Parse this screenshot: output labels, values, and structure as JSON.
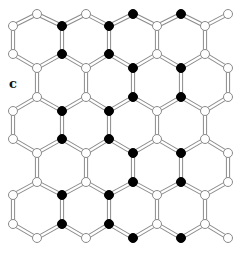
{
  "figure": {
    "panel_label": "c",
    "colors": {
      "background": "#ffffff",
      "bond_outline": "#8a8a8a",
      "bond_fill": "#ffffff",
      "node_white_fill": "#ffffff",
      "node_white_stroke": "#8a8a8a",
      "node_black_fill": "#000000"
    },
    "columns_x": [
      13,
      37,
      62,
      86,
      109,
      133,
      157,
      181,
      205,
      228
    ],
    "levels": [
      {
        "y": 14,
        "nodes": [
          {
            "x": 37,
            "c": "white"
          },
          {
            "x": 86,
            "c": "white"
          },
          {
            "x": 133,
            "c": "black"
          },
          {
            "x": 181,
            "c": "black"
          },
          {
            "x": 228,
            "c": "white"
          }
        ]
      },
      {
        "y": 26,
        "nodes": [
          {
            "x": 13,
            "c": "white"
          },
          {
            "x": 62,
            "c": "black"
          },
          {
            "x": 109,
            "c": "black"
          },
          {
            "x": 157,
            "c": "white"
          },
          {
            "x": 205,
            "c": "white"
          }
        ]
      },
      {
        "y": 54,
        "nodes": [
          {
            "x": 13,
            "c": "white"
          },
          {
            "x": 62,
            "c": "black"
          },
          {
            "x": 109,
            "c": "black"
          },
          {
            "x": 157,
            "c": "white"
          },
          {
            "x": 205,
            "c": "white"
          }
        ]
      },
      {
        "y": 68,
        "nodes": [
          {
            "x": 37,
            "c": "white"
          },
          {
            "x": 86,
            "c": "white"
          },
          {
            "x": 133,
            "c": "black"
          },
          {
            "x": 181,
            "c": "black"
          },
          {
            "x": 228,
            "c": "white"
          }
        ]
      },
      {
        "y": 97,
        "nodes": [
          {
            "x": 37,
            "c": "white"
          },
          {
            "x": 86,
            "c": "white"
          },
          {
            "x": 133,
            "c": "black"
          },
          {
            "x": 181,
            "c": "black"
          },
          {
            "x": 228,
            "c": "white"
          }
        ]
      },
      {
        "y": 111,
        "nodes": [
          {
            "x": 13,
            "c": "white"
          },
          {
            "x": 62,
            "c": "black"
          },
          {
            "x": 109,
            "c": "black"
          },
          {
            "x": 157,
            "c": "white"
          },
          {
            "x": 205,
            "c": "white"
          }
        ]
      },
      {
        "y": 139,
        "nodes": [
          {
            "x": 13,
            "c": "white"
          },
          {
            "x": 62,
            "c": "black"
          },
          {
            "x": 109,
            "c": "black"
          },
          {
            "x": 157,
            "c": "white"
          },
          {
            "x": 205,
            "c": "white"
          }
        ]
      },
      {
        "y": 153,
        "nodes": [
          {
            "x": 37,
            "c": "white"
          },
          {
            "x": 86,
            "c": "white"
          },
          {
            "x": 133,
            "c": "black"
          },
          {
            "x": 181,
            "c": "black"
          },
          {
            "x": 228,
            "c": "white"
          }
        ]
      },
      {
        "y": 182,
        "nodes": [
          {
            "x": 37,
            "c": "white"
          },
          {
            "x": 86,
            "c": "white"
          },
          {
            "x": 133,
            "c": "black"
          },
          {
            "x": 181,
            "c": "black"
          },
          {
            "x": 228,
            "c": "white"
          }
        ]
      },
      {
        "y": 195,
        "nodes": [
          {
            "x": 13,
            "c": "white"
          },
          {
            "x": 62,
            "c": "black"
          },
          {
            "x": 109,
            "c": "black"
          },
          {
            "x": 157,
            "c": "white"
          },
          {
            "x": 205,
            "c": "white"
          }
        ]
      },
      {
        "y": 224,
        "nodes": [
          {
            "x": 13,
            "c": "white"
          },
          {
            "x": 62,
            "c": "black"
          },
          {
            "x": 109,
            "c": "black"
          },
          {
            "x": 157,
            "c": "white"
          },
          {
            "x": 205,
            "c": "white"
          }
        ]
      },
      {
        "y": 238,
        "nodes": [
          {
            "x": 37,
            "c": "white"
          },
          {
            "x": 86,
            "c": "white"
          },
          {
            "x": 133,
            "c": "black"
          },
          {
            "x": 181,
            "c": "black"
          },
          {
            "x": 228,
            "c": "white"
          }
        ]
      }
    ],
    "vertical_bond_level_pairs": [
      [
        1,
        2
      ],
      [
        3,
        4
      ],
      [
        5,
        6
      ],
      [
        7,
        8
      ],
      [
        9,
        10
      ]
    ],
    "diagonal_bond_level_pairs": [
      [
        0,
        1
      ],
      [
        2,
        3
      ],
      [
        4,
        5
      ],
      [
        6,
        7
      ],
      [
        8,
        9
      ],
      [
        10,
        11
      ]
    ],
    "node_radius": 4.5
  }
}
